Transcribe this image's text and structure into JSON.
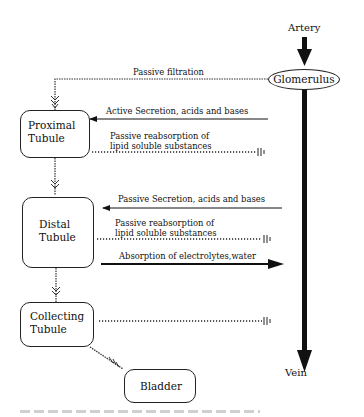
{
  "diagram": {
    "nodes": {
      "artery": "Artery",
      "glomerulus": "Glomerulus",
      "vein": "Vein",
      "proximal": {
        "line1": "Proximal",
        "line2": "Tubule"
      },
      "distal": {
        "line1": "Distal",
        "line2": "Tubule"
      },
      "collecting": {
        "line1": "Collecting",
        "line2": "Tubule"
      },
      "bladder": "Bladder"
    },
    "edges": {
      "filtration": "Passive filtration",
      "proximal_active": "Active Secretion, acids and bases",
      "proximal_passive": {
        "line1": "Passive reabsorption of",
        "line2": "lipid soluble substances"
      },
      "distal_passive_secretion": "Passive Secretion, acids and bases",
      "distal_passive": {
        "line1": "Passive reabsorption of",
        "line2": "lipid soluble substances"
      },
      "distal_absorption": "Absorption of electrolytes,water"
    },
    "colors": {
      "line": "#111111",
      "background": "#ffffff"
    }
  }
}
